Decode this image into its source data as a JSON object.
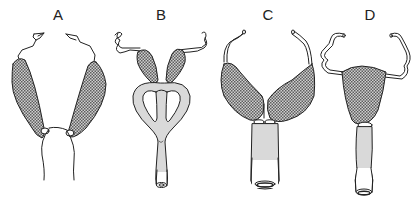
{
  "figure": {
    "panels": [
      {
        "id": "A",
        "label": "A",
        "description": "Uterus with two separate uterine horns and a single cervix/vagina (unshaded)"
      },
      {
        "id": "B",
        "label": "B",
        "description": "Two small uterine horns joined to a looped, shaded duct with a single outlet"
      },
      {
        "id": "C",
        "label": "C",
        "description": "Bicornuate uterus with horns fused at midline above a shaded cervical canal"
      },
      {
        "id": "D",
        "label": "D",
        "description": "Single simplex uterine body with coiled tubes and a shaded cervical canal"
      }
    ],
    "legend": {
      "crosshatch": "uterine body",
      "grey_fill": "cervical / vaginal tissue",
      "outline": "oviduct"
    },
    "colors": {
      "stroke": "#222222",
      "grey_fill": "#d9d9d9",
      "hatch_dark": "#6a6a6a",
      "hatch_light": "#c8c8c8",
      "background": "#ffffff"
    }
  }
}
